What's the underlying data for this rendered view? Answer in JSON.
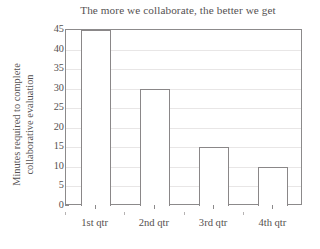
{
  "chart_data": {
    "type": "bar",
    "title": "The more we collaborate, the better we get",
    "xlabel": "",
    "ylabel_line1": "Minutes required to complete",
    "ylabel_line2": "collaborative evaluation",
    "categories": [
      "1st qtr",
      "2nd qtr",
      "3rd qtr",
      "4th qtr"
    ],
    "values": [
      45,
      30,
      15,
      10
    ],
    "ylim": [
      0,
      45
    ],
    "ytick_values": [
      0,
      5,
      10,
      15,
      20,
      25,
      30,
      35,
      40,
      45
    ],
    "ytick_labels": [
      "0",
      "5",
      "10",
      "15",
      "20",
      "25",
      "30",
      "35",
      "40",
      "45"
    ],
    "grid": true,
    "legend": false,
    "series": [
      {
        "name": "Minutes required to complete collaborative evaluation",
        "values": [
          45,
          30,
          15,
          10
        ]
      }
    ],
    "colors": {
      "bar_fill": "#ffffff",
      "bar_stroke": "#8a8788",
      "axis": "#8c8a8b",
      "gridline": "#e8e6e6",
      "text": "#55514f",
      "background": "#ffffff"
    }
  }
}
